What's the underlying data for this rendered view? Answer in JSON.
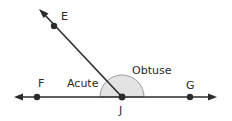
{
  "diagram": {
    "points": {
      "E": {
        "label": "E",
        "x": 54,
        "y": 26
      },
      "F": {
        "label": "F",
        "x": 37,
        "y": 97
      },
      "G": {
        "label": "G",
        "x": 190,
        "y": 97
      },
      "J": {
        "label": "J",
        "x": 122,
        "y": 97
      }
    },
    "angle_labels": {
      "acute": "Acute",
      "obtuse": "Obtuse"
    },
    "colors": {
      "line": "#2b2b2b",
      "arc_fill": "#e3e3e3",
      "arc_stroke": "#9a9a9a"
    }
  }
}
